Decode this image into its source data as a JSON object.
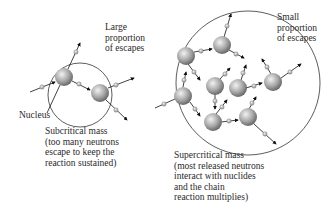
{
  "labels": {
    "large_escapes": "Large\nproportion\nof escapes",
    "small_escapes": "Small\nproportion\nof escapes",
    "nucleus": "Nucleus",
    "subcritical": "Subcritical mass\n(too many neutrons\nescape to keep the\nreaction sustained)",
    "supercritical": "Supercritical mass\n(most released neutrons\ninteract with nuclides\nand the chain\nreaction multiplies)"
  },
  "diagram": {
    "subcritical": {
      "boundary": {
        "cx": 80,
        "cy": 95,
        "r": 32
      },
      "nuclei": [
        {
          "cx": 64,
          "cy": 77,
          "r": 9
        },
        {
          "cx": 100,
          "cy": 93,
          "r": 9
        }
      ]
    },
    "supercritical": {
      "boundary": {
        "cx": 248,
        "cy": 83,
        "r": 72
      },
      "nuclei": [
        {
          "cx": 222,
          "cy": 45,
          "r": 9
        },
        {
          "cx": 186,
          "cy": 56,
          "r": 9
        },
        {
          "cx": 273,
          "cy": 82,
          "r": 9
        },
        {
          "cx": 215,
          "cy": 86,
          "r": 9
        },
        {
          "cx": 238,
          "cy": 88,
          "r": 9
        },
        {
          "cx": 183,
          "cy": 96,
          "r": 9
        },
        {
          "cx": 213,
          "cy": 122,
          "r": 9
        },
        {
          "cx": 248,
          "cy": 117,
          "r": 9
        }
      ]
    },
    "colors": {
      "boundary": "#333333",
      "nucleus_light": "#e8e8e8",
      "nucleus_dark": "#6e6e6e",
      "neutron": "#bdbdbd",
      "arrow": "#111111"
    }
  }
}
